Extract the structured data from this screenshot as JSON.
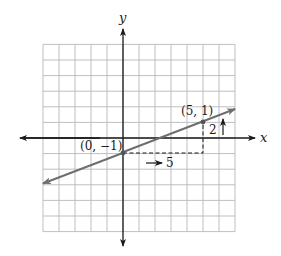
{
  "chart_data": {
    "type": "line",
    "title": "",
    "xlabel": "x",
    "ylabel": "y",
    "xlim": [
      -5,
      7
    ],
    "ylim": [
      -6,
      6
    ],
    "grid": true,
    "series": [
      {
        "name": "line",
        "equation": "y = (2/5)x - 1",
        "slope": 0.4,
        "intercept": -1,
        "x": [
          -5,
          7
        ],
        "y": [
          -3,
          1.8
        ],
        "color": "#6e6e6e"
      }
    ],
    "points": [
      {
        "label": "(0, −1)",
        "x": 0,
        "y": -1
      },
      {
        "label": "(5, 1)",
        "x": 5,
        "y": 1
      }
    ],
    "annotations": [
      {
        "type": "run",
        "label": "5",
        "from": [
          0,
          -1
        ],
        "to": [
          5,
          -1
        ],
        "style": "dashed"
      },
      {
        "type": "rise",
        "label": "2",
        "from": [
          5,
          -1
        ],
        "to": [
          5,
          1
        ],
        "style": "dashed"
      }
    ]
  },
  "labels": {
    "x_axis": "x",
    "y_axis": "y",
    "point_a": "(0, −1)",
    "point_b": "(5, 1)",
    "run": "5",
    "rise": "2"
  },
  "colors": {
    "grid": "#b8b8b8",
    "axis": "#1a1a1a",
    "line": "#6e6e6e",
    "dash": "#1a1a1a"
  }
}
